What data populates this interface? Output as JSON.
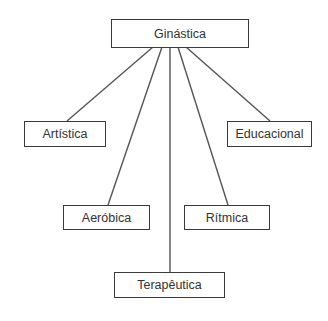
{
  "diagram": {
    "type": "tree",
    "root": {
      "id": "ginastica",
      "label": "Ginástica",
      "box": [
        111,
        19,
        138,
        28
      ]
    },
    "children": [
      {
        "id": "artistica",
        "label": "Artística",
        "box": [
          24,
          121,
          82,
          25
        ],
        "anchor_from": [
          153,
          47
        ],
        "anchor_to": [
          67,
          121
        ]
      },
      {
        "id": "educacional",
        "label": "Educacional",
        "box": [
          227,
          121,
          85,
          25
        ],
        "anchor_from": [
          186,
          47
        ],
        "anchor_to": [
          270,
          121
        ]
      },
      {
        "id": "aerobica",
        "label": "Aeróbica",
        "box": [
          63,
          205,
          87,
          24
        ],
        "anchor_from": [
          162,
          47
        ],
        "anchor_to": [
          108,
          205
        ]
      },
      {
        "id": "ritmica",
        "label": "Rítmica",
        "box": [
          184,
          205,
          86,
          24
        ],
        "anchor_from": [
          178,
          47
        ],
        "anchor_to": [
          228,
          205
        ]
      },
      {
        "id": "terapeutica",
        "label": "Terapêutica",
        "box": [
          114,
          272,
          111,
          25
        ],
        "anchor_from": [
          170,
          47
        ],
        "anchor_to": [
          170,
          272
        ]
      }
    ],
    "colors": {
      "line": "#555555",
      "border": "#3a3a3a",
      "text": "#333333",
      "background": "#ffffff"
    }
  }
}
